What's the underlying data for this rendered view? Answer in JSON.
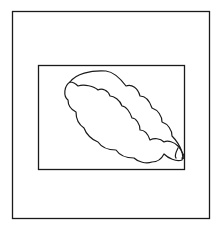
{
  "diagram": {
    "background": "#ffffff",
    "stroke_color": "#1a1a1a",
    "outer_frame": {
      "x": 12,
      "y": 11,
      "width": 197,
      "height": 207
    },
    "inner_frame": {
      "x": 38,
      "y": 65,
      "width": 146,
      "height": 104
    },
    "shape": {
      "type": "cloud",
      "orientation": "diagonal top-left to bottom-right"
    }
  }
}
